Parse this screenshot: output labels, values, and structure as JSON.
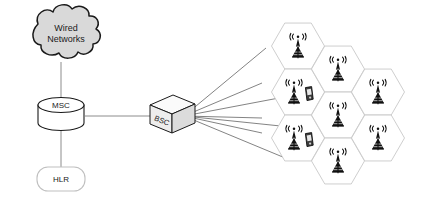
{
  "diagram": {
    "background_color": "#ffffff",
    "line_color": "#808080",
    "stroke_dark": "#1a1a1a",
    "hex_stroke": "#c8c8c8",
    "cloud_fill": "#d9d9d9",
    "box_fill": "#f2f2f2"
  },
  "nodes": {
    "cloud": {
      "name": "wired-networks-cloud",
      "label_line1": "Wired",
      "label_line2": "Networks",
      "fill": "#d9d9d9",
      "stroke": "#1a1a1a"
    },
    "msc": {
      "name": "msc-cylinder",
      "label": "MSC",
      "fill": "#ffffff",
      "stroke": "#1a1a1a"
    },
    "hlr": {
      "name": "hlr-node",
      "label": "HLR",
      "fill": "#ffffff",
      "stroke": "#bfbfbf"
    },
    "bsc": {
      "name": "bsc-box",
      "label": "BSC",
      "fill": "#ededed",
      "stroke": "#1a1a1a"
    }
  },
  "links": [
    {
      "name": "link-cloud-msc",
      "from": "cloud",
      "to": "msc"
    },
    {
      "name": "link-msc-hlr",
      "from": "msc",
      "to": "hlr"
    },
    {
      "name": "link-msc-bsc",
      "from": "msc",
      "to": "bsc"
    }
  ],
  "bsc_fan_links": {
    "name": "bsc-to-cells-fan",
    "count": 7,
    "origin": {
      "x": 184,
      "y": 116
    },
    "targets": [
      {
        "x": 266,
        "y": 48
      },
      {
        "x": 262,
        "y": 83
      },
      {
        "x": 300,
        "y": 94
      },
      {
        "x": 262,
        "y": 118
      },
      {
        "x": 300,
        "y": 128
      },
      {
        "x": 262,
        "y": 133
      },
      {
        "x": 290,
        "y": 160
      }
    ]
  },
  "cells": [
    {
      "name": "cell-1",
      "cx": 298,
      "cy": 46,
      "has_tower": true,
      "has_phone": false
    },
    {
      "name": "cell-2",
      "cx": 298,
      "cy": 92,
      "has_tower": true,
      "has_phone": true
    },
    {
      "name": "cell-3",
      "cx": 298,
      "cy": 138,
      "has_tower": true,
      "has_phone": true
    },
    {
      "name": "cell-4",
      "cx": 338,
      "cy": 69,
      "has_tower": true,
      "has_phone": false
    },
    {
      "name": "cell-5",
      "cx": 338,
      "cy": 115,
      "has_tower": true,
      "has_phone": false
    },
    {
      "name": "cell-6",
      "cx": 338,
      "cy": 161,
      "has_tower": true,
      "has_phone": false
    },
    {
      "name": "cell-7",
      "cx": 378,
      "cy": 92,
      "has_tower": true,
      "has_phone": false
    },
    {
      "name": "cell-8",
      "cx": 378,
      "cy": 138,
      "has_tower": true,
      "has_phone": false
    }
  ],
  "icons": {
    "tower": "cell-tower-icon",
    "phone": "mobile-phone-icon",
    "waves": "radio-waves-icon"
  }
}
